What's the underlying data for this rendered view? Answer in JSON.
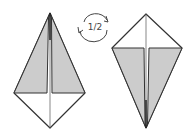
{
  "diagram": {
    "type": "origami-step",
    "rotation_label": "1/2",
    "colors": {
      "paper_front": "#ffffff",
      "paper_back": "#cccccc",
      "stroke": "#333333"
    },
    "figures": [
      {
        "name": "before",
        "description": "kite with gray flaps pointing up"
      },
      {
        "name": "after",
        "description": "kite rotated 1/2, gray flaps pointing down"
      }
    ]
  }
}
